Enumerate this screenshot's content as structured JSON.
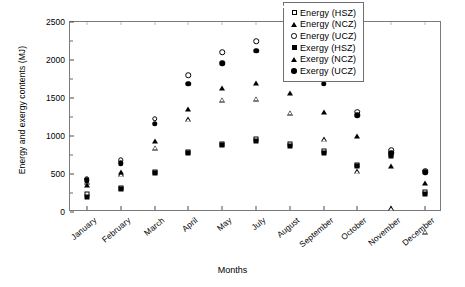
{
  "chart_data": {
    "type": "scatter",
    "title": "",
    "xlabel": "Months",
    "ylabel": "Energy and exergy contents (MJ)",
    "categories": [
      "January",
      "February",
      "March",
      "April",
      "May",
      "July",
      "August",
      "September",
      "October",
      "November",
      "December"
    ],
    "yticks": [
      0,
      500,
      1000,
      1500,
      2000,
      2500
    ],
    "ylim": [
      0,
      2500
    ],
    "grid": false,
    "legend_position": "top-right",
    "series": [
      {
        "name": "Energy (HSZ)",
        "marker": "square-open",
        "values": [
          240,
          320,
          520,
          790,
          900,
          960,
          890,
          800,
          620,
          760,
          260
        ]
      },
      {
        "name": "Energy (NCZ)",
        "marker": "triangle-open",
        "values": [
          400,
          560,
          980,
          1420,
          1740,
          1820,
          1700,
          1420,
          1060,
          640,
          400
        ]
      },
      {
        "name": "Energy (UCZ)",
        "marker": "circle-open",
        "values": [
          440,
          680,
          1230,
          1800,
          2100,
          2250,
          2080,
          1790,
          1320,
          810,
          540
        ]
      },
      {
        "name": "Exergy (HSZ)",
        "marker": "square-filled",
        "values": [
          200,
          300,
          510,
          780,
          880,
          940,
          870,
          780,
          600,
          740,
          240
        ]
      },
      {
        "name": "Exergy (NCZ)",
        "marker": "triangle-filled",
        "values": [
          360,
          520,
          930,
          1350,
          1630,
          1700,
          1560,
          1320,
          1000,
          600,
          380
        ]
      },
      {
        "name": "Exergy (UCZ)",
        "marker": "circle-filled",
        "values": [
          420,
          640,
          1160,
          1690,
          1960,
          2120,
          1950,
          1690,
          1270,
          780,
          520
        ]
      }
    ]
  },
  "legend": {
    "items": [
      {
        "label": "Energy (HSZ)",
        "marker": "square-open"
      },
      {
        "label": "Energy (NCZ)",
        "marker": "triangle-open"
      },
      {
        "label": "Energy (UCZ)",
        "marker": "circle-open"
      },
      {
        "label": "Exergy (HSZ)",
        "marker": "square-filled"
      },
      {
        "label": "Exergy (NCZ)",
        "marker": "triangle-filled"
      },
      {
        "label": "Exergy  (UCZ)",
        "marker": "circle-filled"
      }
    ]
  }
}
